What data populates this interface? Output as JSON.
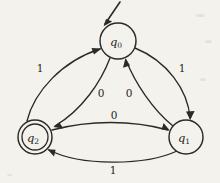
{
  "figure": {
    "kind": "finite-state-automaton",
    "background_color": "#f4f2ed",
    "stroke_color": "#2b2a28",
    "width": 220,
    "height": 183
  },
  "states": [
    {
      "id": "q0",
      "label": "q",
      "subscript": "0",
      "cx": 118,
      "cy": 41,
      "r": 18,
      "accepting": false,
      "start": true
    },
    {
      "id": "q1",
      "label": "q",
      "subscript": "1",
      "cx": 186,
      "cy": 137,
      "r": 17,
      "accepting": false,
      "start": false
    },
    {
      "id": "q2",
      "label": "q",
      "subscript": "2",
      "cx": 35,
      "cy": 137,
      "r": 17,
      "accepting": true,
      "start": false
    }
  ],
  "start_marker": {
    "from_x": 120,
    "from_y": 2,
    "to_x": 104,
    "to_y": 26
  },
  "transitions": [
    {
      "id": "q0-to-q2",
      "from": "q0",
      "to": "q2",
      "symbol": "0",
      "label_x": 101,
      "label_y": 93
    },
    {
      "id": "q1-to-q0",
      "from": "q1",
      "to": "q0",
      "symbol": "0",
      "label_x": 129,
      "label_y": 93
    },
    {
      "id": "q2-to-q1",
      "from": "q2",
      "to": "q1",
      "symbol": "0",
      "label_x": 114,
      "label_y": 115
    },
    {
      "id": "q2-to-q0",
      "from": "q2",
      "to": "q0",
      "symbol": "1",
      "label_x": 40,
      "label_y": 68
    },
    {
      "id": "q0-to-q1",
      "from": "q0",
      "to": "q1",
      "symbol": "1",
      "label_x": 182,
      "label_y": 68
    },
    {
      "id": "q1-to-q2",
      "from": "q1",
      "to": "q2",
      "symbol": "1",
      "label_x": 113,
      "label_y": 170
    }
  ]
}
